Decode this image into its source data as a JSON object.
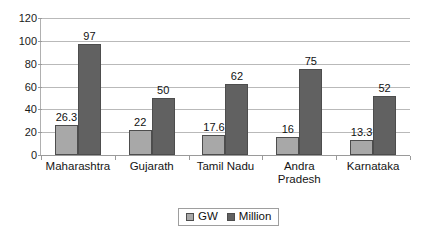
{
  "chart_data": {
    "type": "bar",
    "title": "",
    "subtitle": "",
    "xlabel": "",
    "ylabel": "",
    "ylim": [
      0,
      120
    ],
    "yticks": [
      0,
      20,
      40,
      60,
      80,
      100,
      120
    ],
    "ytick_labels": [
      "0",
      "20",
      "40",
      "60",
      "80",
      "100",
      "120"
    ],
    "grid": true,
    "legend_position": "bottom-center",
    "categories": [
      "Maharashtra",
      "Gujarath",
      "Tamil Nadu",
      "Andra Pradesh",
      "Karnataka"
    ],
    "category_display": [
      "Maharashtra",
      "Gujarath",
      "Tamil Nadu",
      "Andra\nPradesh",
      "Karnataka"
    ],
    "series": [
      {
        "name": "GW",
        "color": "#a8a8a8",
        "values": [
          26.3,
          22,
          17.6,
          16,
          13.3
        ],
        "value_labels": [
          "26.3",
          "22",
          "17.6",
          "16",
          "13.3"
        ]
      },
      {
        "name": "Million",
        "color": "#616161",
        "values": [
          97,
          50,
          62,
          75,
          52
        ],
        "value_labels": [
          "97",
          "50",
          "62",
          "75",
          "52"
        ]
      }
    ]
  },
  "legend": {
    "entries": [
      {
        "label": "GW"
      },
      {
        "label": "Million"
      }
    ]
  }
}
